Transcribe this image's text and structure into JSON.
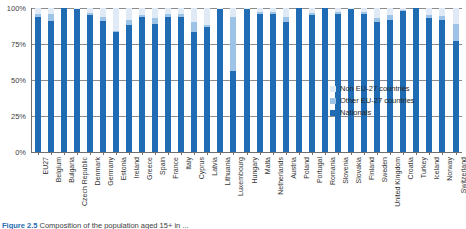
{
  "figure": {
    "caption_number": "Figure 2.5",
    "caption_text": "Composition of the population aged 15+ in ..."
  },
  "axis": {
    "y_ticks": [
      "100%",
      "75%",
      "50%",
      "25%",
      "0%"
    ]
  },
  "legend": {
    "items": [
      {
        "label": "Non EU-27 countries",
        "color": "#dfeaf6"
      },
      {
        "label": "Other EU-27 countries",
        "color": "#9dc3e6"
      },
      {
        "label": "Nationals",
        "color": "#1f6cb4"
      }
    ]
  },
  "chart_data": {
    "type": "bar",
    "stacked": true,
    "title": "",
    "xlabel": "",
    "ylabel": "",
    "ylim": [
      0,
      100
    ],
    "ytick_values": [
      0,
      25,
      50,
      75,
      100
    ],
    "grid": true,
    "legend_position": "inside-right",
    "categories": [
      "EU27",
      "Belgium",
      "Bulgaria",
      "Czech Republic",
      "Denmark",
      "Germany",
      "Estonia",
      "Ireland",
      "Greece",
      "Spain",
      "France",
      "Italy",
      "Cyprus",
      "Latvia",
      "Lithuania",
      "Luxembourg",
      "Hungary",
      "Malta",
      "Netherlands",
      "Austria",
      "Poland",
      "Portugal",
      "Romania",
      "Slovenia",
      "Slovakia",
      "Finland",
      "Sweden",
      "United Kingdom",
      "Croatia",
      "Turkey",
      "Iceland",
      "Norway",
      "Switzerland"
    ],
    "series": [
      {
        "name": "Nationals",
        "color": "#1f6cb4",
        "values": [
          94,
          91,
          100,
          99,
          95,
          91,
          83,
          88,
          94,
          89,
          94,
          94,
          83,
          87,
          99,
          56,
          99,
          96,
          96,
          90,
          100,
          95,
          100,
          96,
          99,
          96,
          90,
          92,
          98,
          100,
          93,
          92,
          77
        ]
      },
      {
        "name": "Other EU-27 countries",
        "color": "#9dc3e6",
        "values": [
          2,
          5,
          0,
          0.5,
          1.5,
          3,
          1,
          4,
          1,
          4,
          2,
          1.5,
          7,
          1,
          0.5,
          38,
          0.5,
          1.5,
          1.5,
          3.5,
          0,
          1.5,
          0,
          1,
          0.5,
          1,
          3,
          3,
          0.5,
          0,
          2,
          2.5,
          12
        ]
      },
      {
        "name": "Non EU-27 countries",
        "color": "#dfeaf6",
        "values": [
          4,
          4,
          0,
          0.5,
          3.5,
          6,
          16,
          8,
          5,
          7,
          4,
          4.5,
          10,
          12,
          0.5,
          6,
          0.5,
          2.5,
          2.5,
          6.5,
          0,
          3.5,
          0,
          3,
          0.5,
          3,
          7,
          5,
          1.5,
          0,
          5,
          5.5,
          11
        ]
      }
    ]
  }
}
